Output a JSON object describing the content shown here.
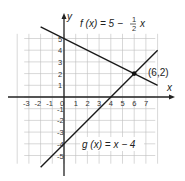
{
  "chart_data": {
    "type": "line",
    "title": "",
    "xlabel": "x",
    "ylabel": "y",
    "xlim": [
      -4,
      8
    ],
    "ylim": [
      -6,
      6
    ],
    "grid": true,
    "x_ticks": [
      "-3",
      "-2",
      "-1",
      "0",
      "1",
      "2",
      "3",
      "4",
      "5",
      "6",
      "7"
    ],
    "y_ticks": [
      "5",
      "4",
      "3",
      "2",
      "1",
      "-1",
      "-2",
      "-3",
      "-4",
      "-5"
    ],
    "series": [
      {
        "name": "f(x) = 5 − ½x",
        "equation": "f(x) = 5 - (1/2)x",
        "x": [
          -2,
          8
        ],
        "y": [
          6,
          1
        ]
      },
      {
        "name": "g(x) = x − 4",
        "equation": "g(x) = x - 4",
        "x": [
          -2,
          8
        ],
        "y": [
          -6,
          4
        ]
      }
    ],
    "annotations": [
      {
        "text": "(6,2)",
        "x": 6,
        "y": 2,
        "type": "intersection-point"
      }
    ]
  },
  "labels": {
    "x_axis": "x",
    "y_axis": "y",
    "f_prefix": "f (x) = 5 −",
    "f_num": "1",
    "f_den": "2",
    "f_suffix": "x",
    "g_label": "g (x) = x − 4",
    "point": "(6,2)"
  },
  "colors": {
    "grid": "#bdbdbd",
    "axis": "#222222",
    "line": "#1a1a1a"
  }
}
